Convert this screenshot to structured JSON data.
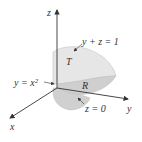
{
  "diagram": {
    "axes": {
      "x": "x",
      "y": "y",
      "z": "z"
    },
    "labels": {
      "plane_top": "y + z = 1",
      "parabolic_cylinder": "y = x²",
      "plane_bottom": "z = 0",
      "solid": "T",
      "region": "R"
    },
    "colors": {
      "surface_light": "#e6e6e6",
      "surface_mid": "#d2d2d2",
      "surface_dark": "#c4c4c4",
      "axis": "#333333"
    }
  }
}
